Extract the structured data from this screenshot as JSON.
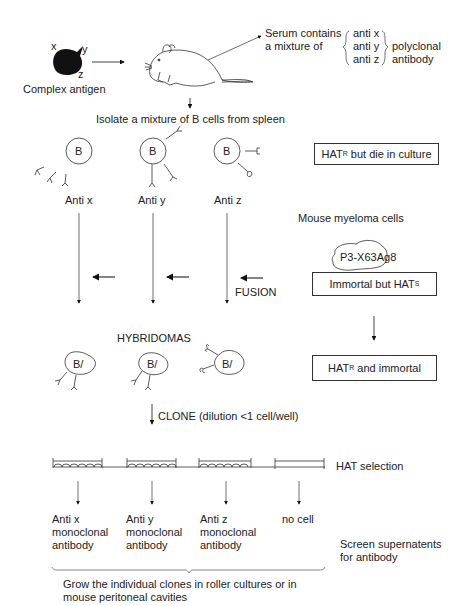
{
  "antigen": {
    "label": "Complex antigen",
    "epitopes": [
      "x",
      "y",
      "z"
    ]
  },
  "serum": {
    "line1": "Serum contains",
    "line2": "a mixture of",
    "antis": [
      "anti x",
      "anti y",
      "anti z"
    ],
    "kind1": "polyclonal",
    "kind2": "antibody"
  },
  "isolate": "Isolate a mixture of B cells from spleen",
  "b_cell_letter": "B",
  "b_cells": [
    "Anti x",
    "Anti y",
    "Anti z"
  ],
  "spleen_box": {
    "main": "HAT",
    "sup": "R",
    "rest": " but die in culture"
  },
  "myeloma": {
    "label": "Mouse myeloma cells",
    "cell_line": "P3-X63Ag8",
    "box_main": "Immortal but HAT",
    "box_sup": "S"
  },
  "fusion": "FUSION",
  "hybridomas": {
    "title": "HYBRIDOMAS",
    "cell_label": "B/"
  },
  "hybrid_box": {
    "main": "HAT",
    "sup": "R",
    "rest": " and immortal"
  },
  "clone": "CLONE (dilution <1 cell/well)",
  "hat_selection": "HAT selection",
  "results": [
    {
      "l1": "Anti x",
      "l2": "monoclonal",
      "l3": "antibody"
    },
    {
      "l1": "Anti y",
      "l2": "monoclonal",
      "l3": "antibody"
    },
    {
      "l1": "Anti z",
      "l2": "monoclonal",
      "l3": "antibody"
    },
    {
      "l1": "no cell",
      "l2": "",
      "l3": ""
    }
  ],
  "screen": {
    "l1": "Screen supernatents",
    "l2": "for antibody"
  },
  "grow": {
    "l1": "Grow the individual clones in roller cultures or in",
    "l2": "mouse peritoneal cavities"
  }
}
